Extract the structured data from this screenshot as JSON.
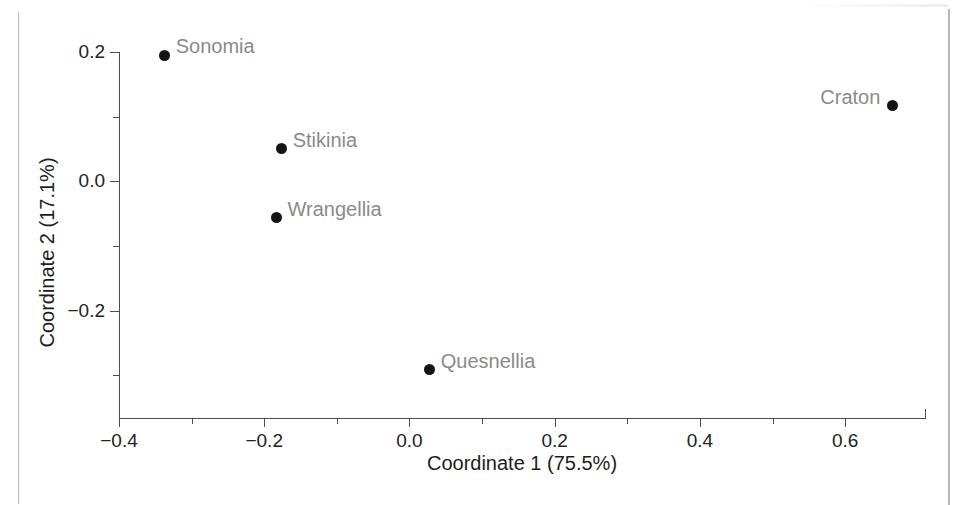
{
  "chart_data": {
    "type": "scatter",
    "title": "",
    "xlabel": "Coordinate 1 (75.5%)",
    "ylabel": "Coordinate 2 (17.1%)",
    "xlim": [
      -0.4,
      0.71
    ],
    "ylim": [
      -0.366,
      0.2
    ],
    "grid": false,
    "legend": "none",
    "x_ticks": [
      {
        "value": -0.4,
        "label": "−0.4",
        "major": true
      },
      {
        "value": -0.3,
        "label": "",
        "major": false
      },
      {
        "value": -0.2,
        "label": "−0.2",
        "major": true
      },
      {
        "value": -0.1,
        "label": "",
        "major": false
      },
      {
        "value": 0.0,
        "label": "0.0",
        "major": true
      },
      {
        "value": 0.1,
        "label": "",
        "major": false
      },
      {
        "value": 0.2,
        "label": "0.2",
        "major": true
      },
      {
        "value": 0.3,
        "label": "",
        "major": false
      },
      {
        "value": 0.4,
        "label": "0.4",
        "major": true
      },
      {
        "value": 0.5,
        "label": "",
        "major": false
      },
      {
        "value": 0.6,
        "label": "0.6",
        "major": true
      }
    ],
    "y_ticks": [
      {
        "value": 0.2,
        "label": "0.2",
        "major": true
      },
      {
        "value": 0.1,
        "label": "",
        "major": false
      },
      {
        "value": 0.0,
        "label": "0.0",
        "major": true
      },
      {
        "value": -0.1,
        "label": "",
        "major": false
      },
      {
        "value": -0.2,
        "label": "−0.2",
        "major": true
      },
      {
        "value": -0.3,
        "label": "",
        "major": false
      }
    ],
    "points": [
      {
        "label": "Sonomia",
        "x": -0.337,
        "y": 0.195,
        "label_side": "right"
      },
      {
        "label": "Stikinia",
        "x": -0.176,
        "y": 0.05,
        "label_side": "right"
      },
      {
        "label": "Wrangellia",
        "x": -0.183,
        "y": -0.056,
        "label_side": "right"
      },
      {
        "label": "Quesnellia",
        "x": 0.028,
        "y": -0.291,
        "label_side": "right"
      },
      {
        "label": "Craton",
        "x": 0.665,
        "y": 0.117,
        "label_side": "left"
      }
    ],
    "colors": {
      "marker": "#141414",
      "point_label": "#8a8a8a",
      "axis": "#4d4d4d",
      "tick_label": "#222222",
      "axis_title": "#1d1d1d",
      "background": "#ffffff"
    }
  }
}
